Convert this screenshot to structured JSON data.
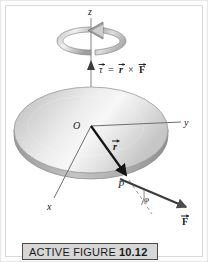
{
  "figure": {
    "domain_kind": "physics-diagram",
    "title_caption": {
      "prefix": "ACTIVE FIGURE",
      "number": "10.12"
    },
    "labels": {
      "z_axis": "z",
      "y_axis": "y",
      "x_axis": "x",
      "origin": "O",
      "point": "P",
      "angle": "φ",
      "r_vector": "r",
      "F_vector": "F",
      "tau_vector": "τ"
    },
    "equation": {
      "tau": "τ",
      "equals": "=",
      "r": "r",
      "cross": "×",
      "F": "F",
      "full_text": "τ = r × F"
    },
    "colors": {
      "page_background": "#ffffff",
      "frame_border": "#d9d9d9",
      "disk_light": "#ffffff",
      "disk_mid": "#d6d6d6",
      "disk_dark": "#a9a9a9",
      "disk_edge": "#8f8f8f",
      "axis_line": "#6f6f6f",
      "vector_dark": "#111111",
      "rotation_arrow_light": "#efefef",
      "rotation_arrow_dark": "#9a9a9a",
      "caption_background": "#d7d7d7",
      "caption_border": "#4a4a4a",
      "caption_text": "#1a1a1a"
    },
    "elements": [
      {
        "name": "rotation-arrow",
        "description": "3D circular arrow around z axis indicating rotation sense"
      },
      {
        "name": "torque-vector",
        "description": "vertical arrow along +z from origin labeled tau"
      },
      {
        "name": "disk",
        "description": "shaded elliptical disk in the xy plane"
      },
      {
        "name": "position-vector",
        "description": "arrow from O to P labeled r"
      },
      {
        "name": "force-vector",
        "description": "arrow through P pointing down-right labeled F"
      },
      {
        "name": "angle-arc",
        "description": "arc between dashed extension of r and F labeled phi"
      }
    ]
  }
}
